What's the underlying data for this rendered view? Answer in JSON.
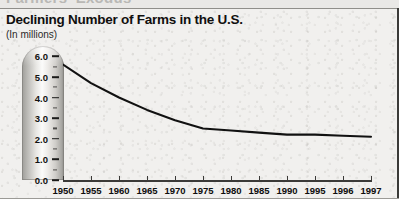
{
  "page": {
    "cutoff_headline": "Farmers' Exodus",
    "background_color": "#f1f0ee"
  },
  "header": {
    "title": "Declining Number of Farms in the U.S.",
    "subtitle": "(In millions)"
  },
  "chart_data": {
    "type": "line",
    "title": "Declining Number of Farms in the U.S.",
    "subtitle": "(In millions)",
    "xlabel": "",
    "ylabel": "(In millions)",
    "categories": [
      "1950",
      "1955",
      "1960",
      "1965",
      "1970",
      "1975",
      "1980",
      "1985",
      "1990",
      "1995",
      "1996",
      "1997"
    ],
    "x": [
      1950,
      1955,
      1960,
      1965,
      1970,
      1975,
      1980,
      1985,
      1990,
      1995,
      1996,
      1997
    ],
    "values": [
      5.6,
      4.7,
      4.0,
      3.4,
      2.9,
      2.5,
      2.4,
      2.3,
      2.2,
      2.2,
      2.15,
      2.1
    ],
    "series": [
      {
        "name": "Number of farms",
        "values": [
          5.6,
          4.7,
          4.0,
          3.4,
          2.9,
          2.5,
          2.4,
          2.3,
          2.2,
          2.2,
          2.15,
          2.1
        ]
      }
    ],
    "ylim": [
      0.0,
      6.5
    ],
    "yticks": [
      0.0,
      1.0,
      2.0,
      3.0,
      4.0,
      5.0,
      6.0
    ],
    "ytick_labels": [
      "0.0",
      "1.0",
      "2.0",
      "3.0",
      "4.0",
      "5.0",
      "6.0"
    ],
    "grid": false,
    "legend": "none",
    "line_color": "#111111",
    "line_width": 2.1
  }
}
